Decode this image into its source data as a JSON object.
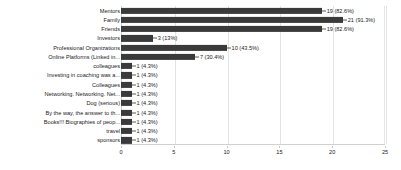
{
  "chart_data": {
    "type": "bar",
    "orientation": "horizontal",
    "title": "",
    "subtitle": "",
    "xlabel": "",
    "ylabel": "",
    "xlim": [
      0,
      25
    ],
    "xticks": [
      0,
      5,
      10,
      15,
      20,
      25
    ],
    "xtick_labels": [
      "0",
      "5",
      "10",
      "15",
      "20",
      "25"
    ],
    "grid": true,
    "legend": false,
    "legend_position": "none",
    "bar_color": "#3a3a3a",
    "background_color": "#ffffff",
    "gridline_color": "#e3e3e3",
    "axis_color": "#d0d0d0",
    "total_responses": 23,
    "categories": [
      "Mentors",
      "Family",
      "Friends",
      "Investors",
      "Professional Organizations",
      "Online Platforms (Linked in...",
      "colleagues",
      "Investing in coaching was a...",
      "Colleagues",
      "Networking. Networking. Net...",
      "Dog (serious)",
      "By the way, the answer to th...",
      "Books!!! Biographies of peop...",
      "travel",
      "sponsors"
    ],
    "values": [
      19,
      21,
      19,
      3,
      10,
      7,
      1,
      1,
      1,
      1,
      1,
      1,
      1,
      1,
      1
    ],
    "percents": [
      "82.6%",
      "91.3%",
      "82.6%",
      "13%",
      "43.5%",
      "30.4%",
      "4.3%",
      "4.3%",
      "4.3%",
      "4.3%",
      "4.3%",
      "4.3%",
      "4.3%",
      "4.3%",
      "4.3%"
    ],
    "data_labels": [
      "19 (82.6%)",
      "21 (91.3%)",
      "19 (82.6%)",
      "3 (13%)",
      "10 (43.5%)",
      "7 (30.4%)",
      "1 (4.3%)",
      "1 (4.3%)",
      "1 (4.3%)",
      "1 (4.3%)",
      "1 (4.3%)",
      "1 (4.3%)",
      "1 (4.3%)",
      "1 (4.3%)",
      "1 (4.3%)"
    ]
  }
}
